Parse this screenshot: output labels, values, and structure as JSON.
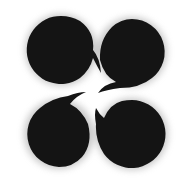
{
  "figure": {
    "icon": "four-commas-pinwheel-icon",
    "fill_color": "#141414",
    "background_color": "#ffffff",
    "shapes": [
      {
        "position": "top-left",
        "cx": 61,
        "cy": 50,
        "r": 34
      },
      {
        "position": "top-right",
        "cx": 132,
        "cy": 52,
        "r": 33
      },
      {
        "position": "bottom-left",
        "cx": 59,
        "cy": 134,
        "r": 33
      },
      {
        "position": "bottom-right",
        "cx": 132,
        "cy": 134,
        "r": 34
      }
    ]
  }
}
